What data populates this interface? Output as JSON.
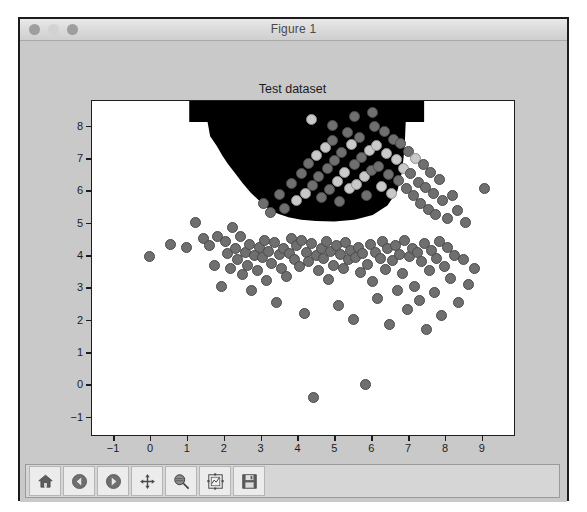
{
  "window": {
    "title": "Figure 1",
    "traffic_lights": [
      "close-button",
      "minimize-button",
      "zoom-button"
    ]
  },
  "toolbar": {
    "buttons": [
      {
        "name": "home-button",
        "label": "Home",
        "icon": "home-icon"
      },
      {
        "name": "back-button",
        "label": "Back",
        "icon": "left-arrow-icon"
      },
      {
        "name": "forward-button",
        "label": "Forward",
        "icon": "right-arrow-icon"
      },
      {
        "name": "pan-button",
        "label": "Pan",
        "icon": "move-cross-icon"
      },
      {
        "name": "zoom-button",
        "label": "Zoom to rectangle",
        "icon": "magnifier-icon"
      },
      {
        "name": "subplots-button",
        "label": "Configure subplots",
        "icon": "subplot-config-icon"
      },
      {
        "name": "save-button",
        "label": "Save the figure",
        "icon": "floppy-save-icon"
      }
    ]
  },
  "chart_data": {
    "type": "scatter",
    "title": "Test dataset",
    "xlabel": "",
    "ylabel": "",
    "xlim": [
      -1.6,
      9.9
    ],
    "ylim": [
      -1.6,
      8.8
    ],
    "xticks": [
      -1,
      0,
      1,
      2,
      3,
      4,
      5,
      6,
      7,
      8,
      9
    ],
    "yticks": [
      -1,
      0,
      1,
      2,
      3,
      4,
      5,
      6,
      7,
      8
    ],
    "grid": false,
    "legend": null,
    "marker": {
      "shape": "circle",
      "facecolor": "#6f6f6f",
      "edgecolor": "#4a4a4a",
      "size": 11
    },
    "highlight_marker": {
      "facecolor": "#c9c9c9",
      "edgecolor": "#8e8e8e"
    },
    "decision_region": {
      "fill": "#000000",
      "description": "black filled classifier decision region occupying the upper-centre of the axes",
      "boundary_xy": [
        [
          1.05,
          8.8
        ],
        [
          1.05,
          8.15
        ],
        [
          1.55,
          8.15
        ],
        [
          1.62,
          7.7
        ],
        [
          1.8,
          7.4
        ],
        [
          1.95,
          7.1
        ],
        [
          2.1,
          6.85
        ],
        [
          2.3,
          6.55
        ],
        [
          2.5,
          6.25
        ],
        [
          2.72,
          5.95
        ],
        [
          2.95,
          5.7
        ],
        [
          3.2,
          5.45
        ],
        [
          3.45,
          5.3
        ],
        [
          3.75,
          5.18
        ],
        [
          4.1,
          5.1
        ],
        [
          4.5,
          5.06
        ],
        [
          5.0,
          5.05
        ],
        [
          5.55,
          5.1
        ],
        [
          6.05,
          5.25
        ],
        [
          6.45,
          5.55
        ],
        [
          6.72,
          6.0
        ],
        [
          6.85,
          6.6
        ],
        [
          6.92,
          7.35
        ],
        [
          6.95,
          8.15
        ],
        [
          7.45,
          8.15
        ],
        [
          7.45,
          8.8
        ]
      ]
    },
    "points": [
      [
        -0.05,
        3.98
      ],
      [
        0.52,
        4.35
      ],
      [
        0.95,
        4.28
      ],
      [
        1.2,
        5.05
      ],
      [
        1.42,
        4.55
      ],
      [
        1.6,
        4.32
      ],
      [
        1.72,
        3.72
      ],
      [
        1.8,
        4.62
      ],
      [
        1.92,
        3.05
      ],
      [
        2.02,
        4.45
      ],
      [
        2.08,
        4.08
      ],
      [
        2.15,
        3.62
      ],
      [
        2.2,
        4.9
      ],
      [
        2.28,
        4.22
      ],
      [
        2.35,
        3.88
      ],
      [
        2.42,
        4.6
      ],
      [
        2.48,
        3.42
      ],
      [
        2.55,
        4.12
      ],
      [
        2.62,
        3.7
      ],
      [
        2.68,
        4.35
      ],
      [
        2.72,
        2.92
      ],
      [
        2.8,
        4.02
      ],
      [
        2.88,
        3.55
      ],
      [
        2.95,
        4.28
      ],
      [
        3.02,
        3.95
      ],
      [
        3.08,
        4.48
      ],
      [
        3.12,
        3.25
      ],
      [
        3.2,
        4.15
      ],
      [
        3.28,
        3.78
      ],
      [
        3.35,
        4.42
      ],
      [
        3.4,
        2.55
      ],
      [
        3.48,
        4.05
      ],
      [
        3.55,
        3.62
      ],
      [
        3.6,
        4.25
      ],
      [
        3.68,
        3.38
      ],
      [
        3.75,
        4.08
      ],
      [
        3.82,
        4.55
      ],
      [
        3.88,
        3.9
      ],
      [
        3.95,
        4.32
      ],
      [
        4.02,
        3.68
      ],
      [
        4.08,
        4.48
      ],
      [
        4.15,
        2.22
      ],
      [
        4.22,
        4.12
      ],
      [
        4.28,
        3.82
      ],
      [
        4.35,
        4.38
      ],
      [
        4.4,
        -0.38
      ],
      [
        4.48,
        4.02
      ],
      [
        4.55,
        3.55
      ],
      [
        4.62,
        4.25
      ],
      [
        4.68,
        3.92
      ],
      [
        4.75,
        4.45
      ],
      [
        4.82,
        3.28
      ],
      [
        4.88,
        4.15
      ],
      [
        4.95,
        3.7
      ],
      [
        5.02,
        4.32
      ],
      [
        5.08,
        2.48
      ],
      [
        5.15,
        4.05
      ],
      [
        5.22,
        3.62
      ],
      [
        5.28,
        4.42
      ],
      [
        5.35,
        3.88
      ],
      [
        5.42,
        4.18
      ],
      [
        5.48,
        2.05
      ],
      [
        5.55,
        3.95
      ],
      [
        5.62,
        4.28
      ],
      [
        5.68,
        3.48
      ],
      [
        5.75,
        4.08
      ],
      [
        5.82,
        0.02
      ],
      [
        5.88,
        3.75
      ],
      [
        5.95,
        4.35
      ],
      [
        6.02,
        3.22
      ],
      [
        6.08,
        4.12
      ],
      [
        6.15,
        2.68
      ],
      [
        6.22,
        3.92
      ],
      [
        6.28,
        4.45
      ],
      [
        6.35,
        3.58
      ],
      [
        6.42,
        4.22
      ],
      [
        6.48,
        1.88
      ],
      [
        6.55,
        3.85
      ],
      [
        6.62,
        4.32
      ],
      [
        6.68,
        2.92
      ],
      [
        6.75,
        4.05
      ],
      [
        6.82,
        3.45
      ],
      [
        6.88,
        4.48
      ],
      [
        6.95,
        2.35
      ],
      [
        7.02,
        3.98
      ],
      [
        7.08,
        4.25
      ],
      [
        7.15,
        3.05
      ],
      [
        7.22,
        4.12
      ],
      [
        7.28,
        2.62
      ],
      [
        7.35,
        3.82
      ],
      [
        7.42,
        4.38
      ],
      [
        7.48,
        1.72
      ],
      [
        7.55,
        3.55
      ],
      [
        7.62,
        4.18
      ],
      [
        7.68,
        2.88
      ],
      [
        7.75,
        3.92
      ],
      [
        7.82,
        4.45
      ],
      [
        7.88,
        2.15
      ],
      [
        7.95,
        3.68
      ],
      [
        8.05,
        4.28
      ],
      [
        8.12,
        3.32
      ],
      [
        8.22,
        4.02
      ],
      [
        8.35,
        2.55
      ],
      [
        8.48,
        3.88
      ],
      [
        8.62,
        3.12
      ],
      [
        8.78,
        3.62
      ],
      [
        9.05,
        6.1
      ],
      [
        3.05,
        5.62
      ],
      [
        3.25,
        5.35
      ],
      [
        3.48,
        5.92
      ],
      [
        3.62,
        5.48
      ],
      [
        3.82,
        6.25
      ],
      [
        3.95,
        5.72
      ],
      [
        4.08,
        6.55
      ],
      [
        4.18,
        5.95
      ],
      [
        4.28,
        6.88
      ],
      [
        4.38,
        6.18
      ],
      [
        4.48,
        7.12
      ],
      [
        4.55,
        6.45
      ],
      [
        4.62,
        5.82
      ],
      [
        4.72,
        7.35
      ],
      [
        4.78,
        6.72
      ],
      [
        4.85,
        6.05
      ],
      [
        4.92,
        7.58
      ],
      [
        4.98,
        6.95
      ],
      [
        5.05,
        6.32
      ],
      [
        5.12,
        5.68
      ],
      [
        5.18,
        7.22
      ],
      [
        5.25,
        6.58
      ],
      [
        5.32,
        7.82
      ],
      [
        5.38,
        6.08
      ],
      [
        5.45,
        7.45
      ],
      [
        5.52,
        6.82
      ],
      [
        5.58,
        6.22
      ],
      [
        5.65,
        7.68
      ],
      [
        5.72,
        7.05
      ],
      [
        5.78,
        6.45
      ],
      [
        5.85,
        5.88
      ],
      [
        5.92,
        7.28
      ],
      [
        5.98,
        6.65
      ],
      [
        6.05,
        8.02
      ],
      [
        6.12,
        7.42
      ],
      [
        6.18,
        6.78
      ],
      [
        6.25,
        6.15
      ],
      [
        6.32,
        7.85
      ],
      [
        6.38,
        7.18
      ],
      [
        6.45,
        6.52
      ],
      [
        6.52,
        5.95
      ],
      [
        6.58,
        7.62
      ],
      [
        6.65,
        6.98
      ],
      [
        6.72,
        6.35
      ],
      [
        6.78,
        7.48
      ],
      [
        6.85,
        6.72
      ],
      [
        6.92,
        6.08
      ],
      [
        6.98,
        7.25
      ],
      [
        7.05,
        6.55
      ],
      [
        7.12,
        5.88
      ],
      [
        7.18,
        7.02
      ],
      [
        7.25,
        6.28
      ],
      [
        7.32,
        5.62
      ],
      [
        7.38,
        6.82
      ],
      [
        7.45,
        6.12
      ],
      [
        7.52,
        5.45
      ],
      [
        7.58,
        6.58
      ],
      [
        7.65,
        5.95
      ],
      [
        7.72,
        5.28
      ],
      [
        7.82,
        6.38
      ],
      [
        7.92,
        5.72
      ],
      [
        8.05,
        5.15
      ],
      [
        8.18,
        5.88
      ],
      [
        8.32,
        5.42
      ],
      [
        8.52,
        5.05
      ],
      [
        4.35,
        8.22
      ],
      [
        4.92,
        8.05
      ],
      [
        5.52,
        8.32
      ],
      [
        6.02,
        8.45
      ]
    ],
    "highlight_points": [
      [
        4.35,
        8.22
      ],
      [
        5.25,
        6.58
      ],
      [
        4.92,
        6.95
      ],
      [
        5.58,
        6.22
      ],
      [
        6.12,
        7.42
      ],
      [
        5.38,
        6.08
      ],
      [
        4.72,
        7.35
      ],
      [
        6.38,
        7.18
      ],
      [
        5.78,
        6.45
      ],
      [
        4.48,
        7.12
      ],
      [
        6.65,
        6.98
      ],
      [
        5.05,
        6.32
      ],
      [
        5.92,
        7.28
      ],
      [
        6.85,
        6.72
      ],
      [
        3.95,
        5.72
      ],
      [
        6.25,
        6.15
      ],
      [
        4.18,
        5.95
      ],
      [
        7.18,
        7.02
      ],
      [
        5.45,
        7.45
      ],
      [
        6.52,
        5.95
      ],
      [
        3.82,
        4.02
      ]
    ]
  }
}
